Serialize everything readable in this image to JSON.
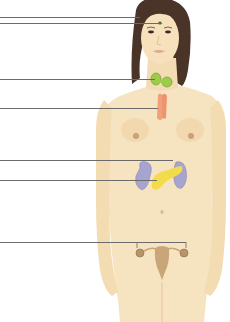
{
  "diagram": {
    "type": "anatomical-labeling-diagram",
    "colors": {
      "background": "#ffffff",
      "skin": "#f6e3c0",
      "skin_shadow": "#e9cfa0",
      "hair": "#4a3428",
      "thyroid": "#9ccc4a",
      "thymus": "#f0a078",
      "adrenal_kidney": "#a8a4d0",
      "pancreas": "#f2dc4a",
      "reproductive": "#c9a57a",
      "leader_line": "#6b6b6b"
    },
    "leader_lines": [
      {
        "id": "pineal",
        "y": 17,
        "x_end": 140,
        "label": ""
      },
      {
        "id": "pituitary",
        "y": 23,
        "x_end": 162,
        "label": ""
      },
      {
        "id": "thyroid",
        "y": 79,
        "x_end": 155,
        "label": ""
      },
      {
        "id": "thymus",
        "y": 108,
        "x_end": 158,
        "label": ""
      },
      {
        "id": "adrenal",
        "y": 160,
        "x_end": 173,
        "label": ""
      },
      {
        "id": "pancreas",
        "y": 180,
        "x_end": 157,
        "label": ""
      },
      {
        "id": "ovaries",
        "y": 242,
        "x_end": 186,
        "label": ""
      }
    ]
  }
}
